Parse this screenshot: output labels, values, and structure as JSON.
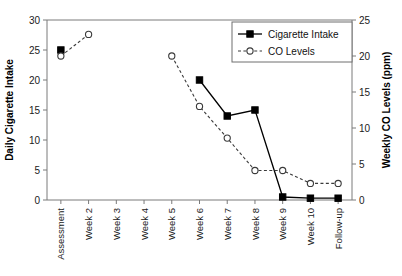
{
  "chart_data": {
    "type": "line",
    "title": "",
    "xlabel": "",
    "ylabel": "Daily Cigarette Intake",
    "y2label": "Weekly CO Levels (ppm)",
    "categories": [
      "Assessment",
      "Week 2",
      "Week 3",
      "Week 4",
      "Week 5",
      "Week 6",
      "Week 7",
      "Week 8",
      "Week 9",
      "Week 10",
      "Follow-up"
    ],
    "ylim": [
      0,
      30
    ],
    "yticks": [
      0,
      5,
      10,
      15,
      20,
      25,
      30
    ],
    "y2lim": [
      0,
      25
    ],
    "y2ticks": [
      0,
      5,
      10,
      15,
      20,
      25
    ],
    "grid": false,
    "legend_position": "top-right",
    "series": [
      {
        "name": "Cigarette Intake",
        "axis": "left",
        "marker": "filled-square",
        "line": "solid",
        "color": "#000000",
        "values": [
          25,
          null,
          null,
          null,
          null,
          20,
          14,
          15,
          0.5,
          0.3,
          0.3
        ]
      },
      {
        "name": "CO Levels",
        "axis": "right",
        "marker": "open-circle",
        "line": "dashed",
        "color": "#3a3a3a",
        "values": [
          20,
          23,
          null,
          null,
          20,
          13,
          8.6,
          4.1,
          4.1,
          2.3,
          2.3
        ]
      }
    ]
  },
  "legend": {
    "items": [
      {
        "label": "Cigarette Intake"
      },
      {
        "label": "CO Levels"
      }
    ]
  }
}
